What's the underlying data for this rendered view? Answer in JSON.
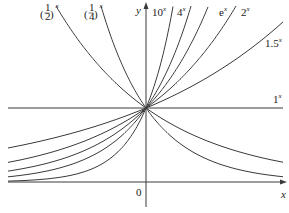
{
  "chart_data": {
    "type": "line",
    "title": "",
    "xlabel": "x",
    "ylabel": "y",
    "origin_label": "0",
    "xlim": [
      -1.92,
      1.92
    ],
    "ylim": [
      -0.3,
      2.4
    ],
    "grid": false,
    "legend": "inline labels at curve ends",
    "series": [
      {
        "name": "(1/2)^x",
        "base": 0.5,
        "label_num": "1",
        "label_den": "2"
      },
      {
        "name": "(1/4)^x",
        "base": 0.25,
        "label_num": "1",
        "label_den": "4"
      },
      {
        "name": "10^x",
        "base": 10,
        "label": "10"
      },
      {
        "name": "4^x",
        "base": 4,
        "label": "4"
      },
      {
        "name": "e^x",
        "base": 2.718281828,
        "label": "e"
      },
      {
        "name": "2^x",
        "base": 2,
        "label": "2"
      },
      {
        "name": "1.5^x",
        "base": 1.5,
        "label": "1.5"
      },
      {
        "name": "1^x",
        "base": 1,
        "label": "1"
      }
    ],
    "exponent_label": "x",
    "annotations": [
      "All curves pass through (0, 1)"
    ]
  },
  "layout": {
    "origin_px": [
      146,
      182
    ],
    "px_per_unit_x": 72,
    "px_per_unit_y": 74,
    "plot_left": 8,
    "plot_right": 283,
    "plot_top": 5,
    "curve_color": "#3a3a3a"
  }
}
